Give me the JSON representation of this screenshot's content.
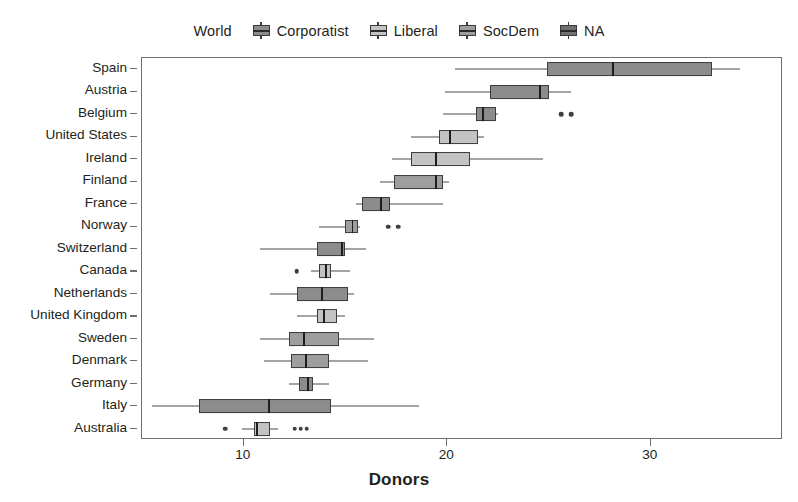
{
  "chart_data": {
    "type": "boxplot",
    "title": "",
    "xlabel": "Donors",
    "ylabel": "",
    "xlim": [
      5.0,
      36.5
    ],
    "xticks": [
      10,
      20,
      30
    ],
    "xticklabels": [
      "10",
      "20",
      "30"
    ],
    "grid": false,
    "legend": {
      "position": "top-center",
      "entries": [
        {
          "label": "World",
          "swatch": false,
          "fill": ""
        },
        {
          "label": "Corporatist",
          "swatch": true,
          "fill": "#8c8c8c"
        },
        {
          "label": "Liberal",
          "swatch": true,
          "fill": "#c3c3c3"
        },
        {
          "label": "SocDem",
          "swatch": true,
          "fill": "#9e9e9e"
        },
        {
          "label": "NA",
          "swatch": true,
          "fill": "#707070"
        }
      ]
    },
    "categories": [
      "Spain",
      "Austria",
      "Belgium",
      "United States",
      "Ireland",
      "Finland",
      "France",
      "Norway",
      "Switzerland",
      "Canada",
      "Netherlands",
      "United Kingdom",
      "Sweden",
      "Denmark",
      "Germany",
      "Italy",
      "Australia"
    ],
    "boxes": [
      {
        "country": "Spain",
        "group": "Corporatist",
        "fill": "#8c8c8c",
        "whisker_low": 20.4,
        "q1": 24.9,
        "median": 28.1,
        "q3": 33.0,
        "whisker_high": 34.4,
        "outliers": []
      },
      {
        "country": "Austria",
        "group": "Corporatist",
        "fill": "#8c8c8c",
        "whisker_low": 19.9,
        "q1": 22.1,
        "median": 24.5,
        "q3": 25.0,
        "whisker_high": 26.1,
        "outliers": []
      },
      {
        "country": "Belgium",
        "group": "Corporatist",
        "fill": "#8c8c8c",
        "whisker_low": 19.8,
        "q1": 21.4,
        "median": 21.7,
        "q3": 22.4,
        "whisker_high": 22.5,
        "outliers": [
          25.6,
          26.1
        ]
      },
      {
        "country": "United States",
        "group": "Liberal",
        "fill": "#c3c3c3",
        "whisker_low": 18.2,
        "q1": 19.6,
        "median": 20.1,
        "q3": 21.5,
        "whisker_high": 21.8,
        "outliers": []
      },
      {
        "country": "Ireland",
        "group": "Liberal",
        "fill": "#c3c3c3",
        "whisker_low": 17.3,
        "q1": 18.2,
        "median": 19.4,
        "q3": 21.1,
        "whisker_high": 24.7,
        "outliers": []
      },
      {
        "country": "Finland",
        "group": "SocDem",
        "fill": "#9e9e9e",
        "whisker_low": 16.7,
        "q1": 17.4,
        "median": 19.4,
        "q3": 19.8,
        "whisker_high": 20.1,
        "outliers": []
      },
      {
        "country": "France",
        "group": "Corporatist",
        "fill": "#8c8c8c",
        "whisker_low": 15.5,
        "q1": 15.8,
        "median": 16.7,
        "q3": 17.2,
        "whisker_high": 19.8,
        "outliers": []
      },
      {
        "country": "Norway",
        "group": "SocDem",
        "fill": "#9e9e9e",
        "whisker_low": 13.7,
        "q1": 15.0,
        "median": 15.3,
        "q3": 15.6,
        "whisker_high": 15.7,
        "outliers": [
          17.1,
          17.6
        ]
      },
      {
        "country": "Switzerland",
        "group": "Corporatist",
        "fill": "#8c8c8c",
        "whisker_low": 10.8,
        "q1": 13.6,
        "median": 14.8,
        "q3": 15.0,
        "whisker_high": 16.0,
        "outliers": []
      },
      {
        "country": "Canada",
        "group": "Liberal",
        "fill": "#c3c3c3",
        "whisker_low": 13.3,
        "q1": 13.7,
        "median": 14.0,
        "q3": 14.3,
        "whisker_high": 15.2,
        "outliers": [
          12.6
        ]
      },
      {
        "country": "Netherlands",
        "group": "Corporatist",
        "fill": "#8c8c8c",
        "whisker_low": 11.3,
        "q1": 12.6,
        "median": 13.8,
        "q3": 15.1,
        "whisker_high": 15.4,
        "outliers": []
      },
      {
        "country": "United Kingdom",
        "group": "Liberal",
        "fill": "#c3c3c3",
        "whisker_low": 12.6,
        "q1": 13.6,
        "median": 13.9,
        "q3": 14.6,
        "whisker_high": 15.0,
        "outliers": []
      },
      {
        "country": "Sweden",
        "group": "SocDem",
        "fill": "#9e9e9e",
        "whisker_low": 10.8,
        "q1": 12.2,
        "median": 12.9,
        "q3": 14.7,
        "whisker_high": 16.4,
        "outliers": []
      },
      {
        "country": "Denmark",
        "group": "SocDem",
        "fill": "#9e9e9e",
        "whisker_low": 11.0,
        "q1": 12.3,
        "median": 13.0,
        "q3": 14.2,
        "whisker_high": 16.1,
        "outliers": []
      },
      {
        "country": "Germany",
        "group": "Corporatist",
        "fill": "#8c8c8c",
        "whisker_low": 12.2,
        "q1": 12.7,
        "median": 13.1,
        "q3": 13.4,
        "whisker_high": 14.2,
        "outliers": []
      },
      {
        "country": "Italy",
        "group": "Corporatist",
        "fill": "#8c8c8c",
        "whisker_low": 5.5,
        "q1": 7.8,
        "median": 11.2,
        "q3": 14.3,
        "whisker_high": 18.6,
        "outliers": []
      },
      {
        "country": "Australia",
        "group": "Liberal",
        "fill": "#c3c3c3",
        "whisker_low": 9.9,
        "q1": 10.5,
        "median": 10.6,
        "q3": 11.3,
        "whisker_high": 11.7,
        "outliers": [
          9.1,
          12.5,
          12.8,
          13.1
        ]
      }
    ]
  }
}
